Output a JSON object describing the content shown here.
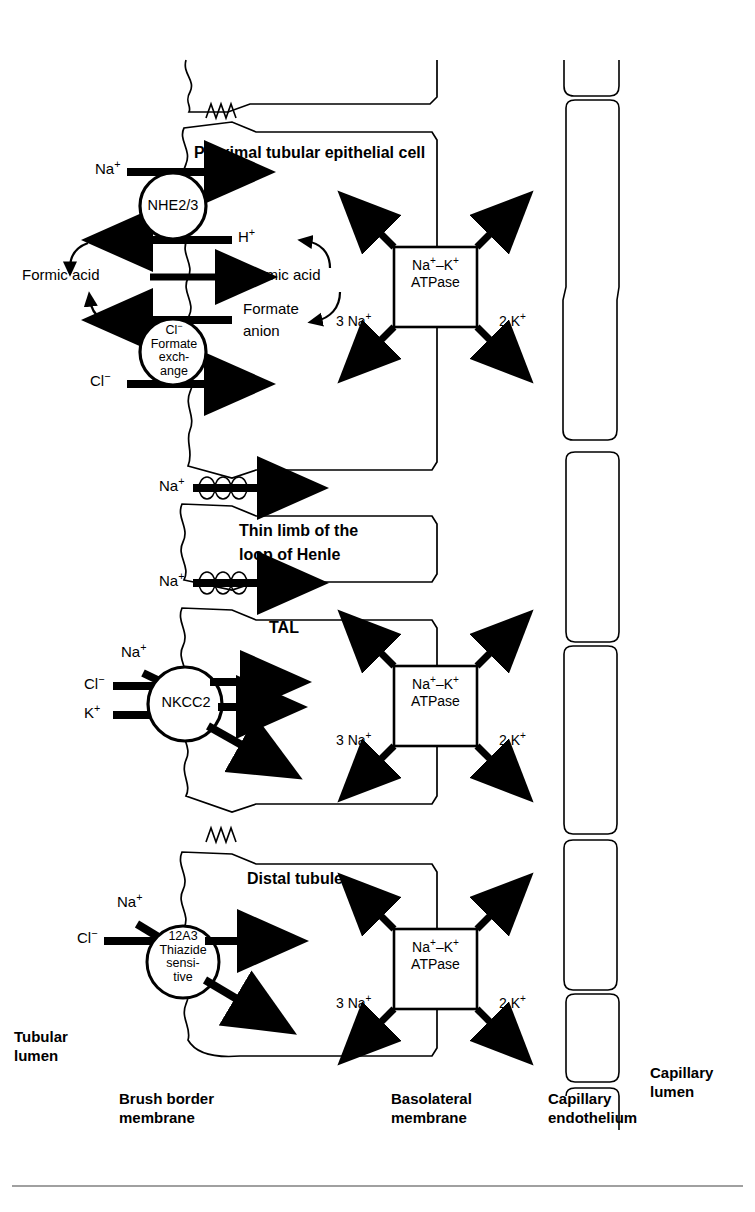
{
  "figure": {
    "background_color": "#ffffff",
    "line_color": "#000000"
  },
  "section_titles": {
    "proximal": "Proximal tubular epithelial cell",
    "thin_limb_line1": "Thin limb of the",
    "thin_limb_line2": "loop of Henle",
    "tal": "TAL",
    "distal": "Distal tubule"
  },
  "ions": {
    "na": "Na",
    "na_sup": "+",
    "h": "H",
    "h_sup": "+",
    "cl": "Cl",
    "cl_sup": "−",
    "k": "K",
    "k_sup": "+",
    "three_na": "3 Na",
    "two_k": "2 K"
  },
  "proximal": {
    "apical_carrier": {
      "name": "NHE2/3",
      "in_label": "Na",
      "in_sup": "+",
      "out_label": "H",
      "out_sup": "+"
    },
    "formic_acid_left": "Formic acid",
    "formic_acid_right": "Formic acid",
    "formate_anion_line1": "Formate",
    "formate_anion_line2": "anion",
    "exchanger": {
      "line1": "Cl",
      "line1_sup": "−",
      "line2": "Formate",
      "line3": "exch-",
      "line4": "ange",
      "in_label": "Cl",
      "in_sup": "−"
    }
  },
  "tal": {
    "carrier": {
      "name": "NKCC2",
      "in1": "Na",
      "in1_sup": "+",
      "in2": "Cl",
      "in2_sup": "−",
      "in3": "K",
      "in3_sup": "+"
    }
  },
  "distal": {
    "carrier": {
      "line1": "12A3",
      "line2": "Thiazide",
      "line3": "sensi-",
      "line4": "tive",
      "in1": "Na",
      "in1_sup": "+",
      "in2": "Cl",
      "in2_sup": "−"
    }
  },
  "pumps": [
    {
      "id": "pump-proximal",
      "line1": "Na",
      "line1_sup": "+",
      "line1_dash": "–K",
      "line1_sup2": "+",
      "line2": "ATPase",
      "bottom_left": "3 Na",
      "bottom_left_sup": "+",
      "bottom_right": "2 K",
      "bottom_right_sup": "+"
    },
    {
      "id": "pump-tal",
      "line1": "Na",
      "line1_sup": "+",
      "line1_dash": "–K",
      "line1_sup2": "+",
      "line2": "ATPase",
      "bottom_left": "3 Na",
      "bottom_left_sup": "+",
      "bottom_right": "2 K",
      "bottom_right_sup": "+"
    },
    {
      "id": "pump-distal",
      "line1": "Na",
      "line1_sup": "+",
      "line1_dash": "–K",
      "line1_sup2": "+",
      "line2": "ATPase",
      "bottom_left": "3 Na",
      "bottom_left_sup": "+",
      "bottom_right": "2 K",
      "bottom_right_sup": "+"
    }
  ],
  "paracellular": {
    "label1": "Na",
    "label1_sup": "+",
    "label2": "Na",
    "label2_sup": "+"
  },
  "footer": {
    "tubular_lumen_line1": "Tubular",
    "tubular_lumen_line2": "lumen",
    "brush_border_line1": "Brush border",
    "brush_border_line2": "membrane",
    "basolateral_line1": "Basolateral",
    "basolateral_line2": "membrane",
    "capillary_endothelium_line1": "Capillary",
    "capillary_endothelium_line2": "endothelium",
    "capillary_lumen_line1": "Capillary",
    "capillary_lumen_line2": "lumen"
  }
}
